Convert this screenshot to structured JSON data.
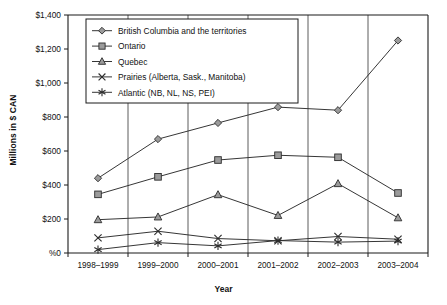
{
  "chart_data": {
    "type": "line",
    "title": "",
    "xlabel": "Year",
    "ylabel": "Millions in $ CAN",
    "categories": [
      "1998–1999",
      "1999–2000",
      "2000–2001",
      "2001–2002",
      "2002–2003",
      "2003–2004"
    ],
    "ylim": [
      0,
      1400
    ],
    "ytick_values": [
      0,
      200,
      400,
      600,
      800,
      1000,
      1200,
      1400
    ],
    "ytick_labels": [
      "%0",
      "$200",
      "$400",
      "$600",
      "$800",
      "$1,000",
      "$1,200",
      "$1,400"
    ],
    "grid": "vertical",
    "legend_position": "upper-left-inside",
    "series": [
      {
        "name": "British Columbia and the territories",
        "marker": "diamond",
        "values": [
          440,
          670,
          765,
          858,
          840,
          1250
        ]
      },
      {
        "name": "Ontario",
        "marker": "square",
        "values": [
          345,
          448,
          547,
          575,
          563,
          353
        ]
      },
      {
        "name": "Quebec",
        "marker": "triangle",
        "values": [
          196,
          212,
          343,
          221,
          408,
          207
        ]
      },
      {
        "name": "Prairies (Alberta, Sask., Manitoba)",
        "marker": "cross",
        "values": [
          89,
          128,
          85,
          72,
          97,
          81
        ]
      },
      {
        "name": "Atlantic (NB, NL, NS, PEI)",
        "marker": "asterisk",
        "values": [
          20,
          61,
          42,
          73,
          64,
          70
        ]
      }
    ]
  },
  "colors": {
    "line": "#2b2b2b",
    "marker_fill": "#9b9b9b",
    "axis": "#1a1a1a",
    "grid": "#4a4a4a",
    "background": "#ffffff"
  }
}
